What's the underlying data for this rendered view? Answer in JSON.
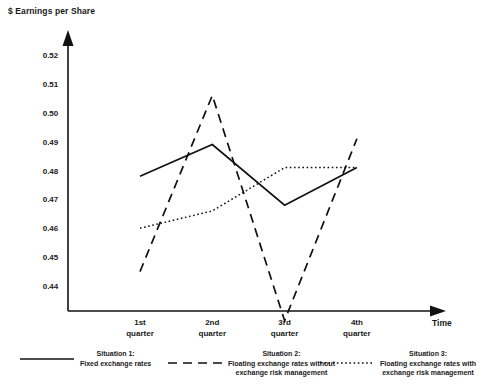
{
  "chart_data": {
    "type": "line",
    "title": "",
    "ylabel": "$ Earnings per Share",
    "xlabel": "Time",
    "categories": [
      "1st quarter",
      "2nd quarter",
      "3rd quarter",
      "4th quarter"
    ],
    "xtick_lines": [
      [
        "1st",
        "quarter"
      ],
      [
        "2nd",
        "quarter"
      ],
      [
        "3rd",
        "quarter"
      ],
      [
        "4th",
        "quarter"
      ]
    ],
    "yticks": [
      "0.44",
      "0.45",
      "0.46",
      "0.47",
      "0.48",
      "0.49",
      "0.50",
      "0.51",
      "0.52"
    ],
    "ytick_values": [
      0.44,
      0.45,
      0.46,
      0.47,
      0.48,
      0.49,
      0.5,
      0.51,
      0.52
    ],
    "ylim": [
      0.428,
      0.528
    ],
    "grid": false,
    "legend_position": "below",
    "series": [
      {
        "name": "Situation 1",
        "label_line1": "Situation 1:",
        "label_line2": "Fixed exchange rates",
        "style": "solid",
        "color": "#111111",
        "values": [
          0.478,
          0.489,
          0.468,
          0.481
        ]
      },
      {
        "name": "Situation 2",
        "label_line1": "Situation 2:",
        "label_line2": "Floating exchange rates without",
        "label_line3": "exchange risk management",
        "style": "dashed",
        "color": "#111111",
        "values": [
          0.445,
          0.506,
          0.428,
          0.491
        ]
      },
      {
        "name": "Situation 3",
        "label_line1": "Situation 3:",
        "label_line2": "Floating exchange rates with",
        "label_line3": "exchange risk management",
        "style": "dotted",
        "color": "#111111",
        "values": [
          0.46,
          0.466,
          0.481,
          0.481
        ]
      }
    ]
  },
  "axes": {
    "y_axis_title": "$ Earnings per Share",
    "x_axis_title": "Time"
  },
  "legend": {
    "items": [
      {
        "key": "solid",
        "line1": "Situation 1:",
        "line2": "Fixed exchange rates",
        "line3": ""
      },
      {
        "key": "dashed",
        "line1": "Situation 2:",
        "line2": "Floating exchange rates without",
        "line3": "exchange risk management"
      },
      {
        "key": "dotted",
        "line1": "Situation 3:",
        "line2": "Floating exchange rates with",
        "line3": "exchange risk management"
      }
    ]
  }
}
